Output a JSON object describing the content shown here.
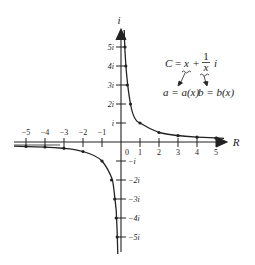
{
  "diagram": {
    "title": "",
    "axes": {
      "horizontal_label": "R",
      "vertical_label": "i",
      "x_ticks": [
        "−5",
        "−4",
        "−3",
        "−2",
        "−1",
        "0",
        "1",
        "2",
        "3",
        "4",
        "5"
      ],
      "y_ticks_positive": [
        "i",
        "2i",
        "3i",
        "4i",
        "5i"
      ],
      "y_ticks_negative": [
        "−i",
        "−2i",
        "−3i",
        "−4i",
        "−5i"
      ]
    },
    "equation": {
      "lhs": "C",
      "equals": "=",
      "term_real": "x",
      "plus": "+",
      "frac_num": "1",
      "frac_den": "x",
      "imag_unit": "i"
    },
    "annotations": {
      "a_label": "a = a(x)",
      "b_label": "b = b(x)"
    },
    "curve": {
      "description": "Hyperbola y = 1/x plotted with x on the real axis and y on the imaginary axis",
      "points_positive": [
        [
          0.2,
          5
        ],
        [
          0.25,
          4
        ],
        [
          0.33,
          3
        ],
        [
          0.5,
          2
        ],
        [
          1,
          1
        ],
        [
          2,
          0.5
        ],
        [
          3,
          0.33
        ],
        [
          4,
          0.25
        ],
        [
          5,
          0.2
        ]
      ],
      "points_negative": [
        [
          -5,
          -0.2
        ],
        [
          -4,
          -0.25
        ],
        [
          -3,
          -0.33
        ],
        [
          -2,
          -0.5
        ],
        [
          -1,
          -1
        ],
        [
          -0.5,
          -2
        ],
        [
          -0.33,
          -3
        ],
        [
          -0.25,
          -4
        ],
        [
          -0.2,
          -5
        ]
      ]
    },
    "colors": {
      "ink": "#222222",
      "background": "#ffffff"
    }
  }
}
